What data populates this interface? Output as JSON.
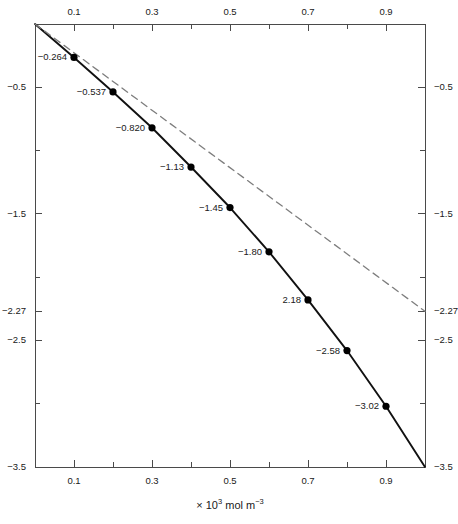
{
  "chart_data": {
    "type": "line",
    "title": "",
    "subtitle": "",
    "xlabel": "× 10³ mol m⁻³",
    "xlabel_parts": {
      "prefix": "× 10",
      "sup1": "3",
      "mid": " mol m",
      "sup2": "−3"
    },
    "ylabel": "",
    "xlim": [
      0,
      1.0
    ],
    "ylim": [
      -3.5,
      0
    ],
    "grid": false,
    "legend": "none",
    "x_ticks_major": [
      "0.1",
      "0.3",
      "0.5",
      "0.7",
      "0.9"
    ],
    "x_tick_values_major": [
      0.1,
      0.3,
      0.5,
      0.7,
      0.9
    ],
    "x_tick_values_minor": [
      0.2,
      0.4,
      0.6,
      0.8,
      1.0
    ],
    "y_ticks_major": [
      "-0.5",
      "-1.5",
      "-2.27",
      "-2.5",
      "-3.5"
    ],
    "y_tick_values_major": [
      -0.5,
      -1.5,
      -2.27,
      -2.5,
      -3.5
    ],
    "y_tick_values_minor": [
      -1.0,
      -2.0,
      -3.0
    ],
    "series": [
      {
        "name": "measured-curve",
        "style": "solid",
        "color": "#111111",
        "marker": "filled-circle",
        "x": [
          0.0,
          0.1,
          0.2,
          0.3,
          0.4,
          0.5,
          0.6,
          0.7,
          0.8,
          0.9,
          1.0
        ],
        "y": [
          0.0,
          -0.264,
          -0.537,
          -0.82,
          -1.13,
          -1.45,
          -1.8,
          -2.18,
          -2.58,
          -3.02,
          -3.5
        ],
        "labels": [
          "",
          "-0.264",
          "-0.537",
          "-0.820",
          "-1.13",
          "-1.45",
          "-1.80",
          "2.18",
          "-2.58",
          "-3.02",
          ""
        ]
      },
      {
        "name": "ideal-reference-line",
        "style": "dashed",
        "color": "#7d7d7d",
        "marker": "none",
        "x": [
          0.0,
          1.0
        ],
        "y": [
          0.0,
          -2.27
        ],
        "labels": [
          "",
          ""
        ]
      }
    ],
    "annotations": [
      {
        "text": "-0.264",
        "x": 0.1,
        "y": -0.264
      },
      {
        "text": "-0.537",
        "x": 0.2,
        "y": -0.537
      },
      {
        "text": "-0.820",
        "x": 0.3,
        "y": -0.82
      },
      {
        "text": "-1.13",
        "x": 0.4,
        "y": -1.13
      },
      {
        "text": "-1.45",
        "x": 0.5,
        "y": -1.45
      },
      {
        "text": "-1.80",
        "x": 0.6,
        "y": -1.8
      },
      {
        "text": "2.18",
        "x": 0.7,
        "y": -2.18
      },
      {
        "text": "-2.58",
        "x": 0.8,
        "y": -2.58
      },
      {
        "text": "-3.02",
        "x": 0.9,
        "y": -3.02
      }
    ]
  },
  "colors": {
    "axis": "#4a4a4a",
    "solid_line": "#111111",
    "dashed_line": "#8a8a8a",
    "marker": "#000000",
    "text": "#202020",
    "background": "#ffffff"
  },
  "geometry": {
    "plot_left": 35,
    "plot_right": 425,
    "plot_top": 24,
    "plot_bottom": 467
  }
}
